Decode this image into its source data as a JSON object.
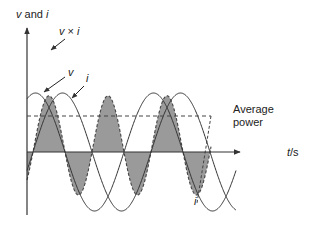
{
  "diagram": {
    "y_axis_label": {
      "var1": "v",
      "conj": " and ",
      "var2": "i"
    },
    "x_axis_label": {
      "var": "t",
      "unit": "/s"
    },
    "labels": {
      "product": {
        "v": "v",
        "times": " × ",
        "i": "i"
      },
      "voltage": "v",
      "current": "i",
      "current_bottom": "i",
      "average_line1": "Average",
      "average_line2": "power"
    },
    "colors": {
      "curve": "#333333",
      "fill": "#9a9a9a",
      "axis": "#333333",
      "text": "#222222"
    },
    "geometry": {
      "origin_x": 27,
      "baseline_y": 152,
      "axis_end_x": 240,
      "axis_top_y": 28,
      "axis_bottom_y": 215,
      "period_px": 118,
      "amplitude_px": 59,
      "v_phase_zero_x": 6,
      "i_phase_zero_x": 33,
      "product_scale": 0.0285,
      "average_y": 116,
      "curve_end_x": 236
    }
  }
}
